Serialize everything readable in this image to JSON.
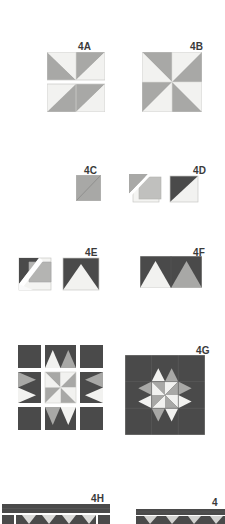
{
  "document": {
    "kind": "quilt-block-piecing-diagram",
    "page_background": "#ffffff"
  },
  "palette": {
    "light": "#f2f2f0",
    "light_shadow": "#e6e6e4",
    "medium": "#a8a8a6",
    "medium_dark": "#8f8f8d",
    "dark": "#4a4a4a",
    "darkest": "#3c3c3c",
    "outline": "#c8c8c6",
    "label_color": "#3a3a3a"
  },
  "figures": [
    {
      "id": "4A",
      "label": "4A",
      "description": "Two hourglass / half-square triangle rectangle units stacked vertically",
      "label_x": 78,
      "label_y": 41,
      "x": 47,
      "y": 52,
      "width": 58,
      "height": 60
    },
    {
      "id": "4B",
      "label": "4B",
      "description": "Four-patch pinwheel square made of eight triangles",
      "label_x": 190,
      "label_y": 41,
      "x": 142,
      "y": 52,
      "width": 60,
      "height": 60
    },
    {
      "id": "4C",
      "label": "4C",
      "description": "Single medium square marked with diagonal stitching line",
      "label_x": 84,
      "label_y": 165,
      "x": 76,
      "y": 175,
      "width": 25,
      "height": 26
    },
    {
      "id": "4D",
      "label": "4D",
      "description": "Sewn and pressed half-square triangle unit, shown folded open beside a finished dark-light triangle square",
      "label_x": 193,
      "label_y": 165,
      "x": 129,
      "y": 173,
      "width": 72,
      "height": 30
    },
    {
      "id": "4E",
      "label": "4E",
      "description": "Flying geese unit in progress and completed dark flying geese with light center triangle",
      "label_x": 85,
      "label_y": 247,
      "x": 17,
      "y": 256,
      "width": 84,
      "height": 36
    },
    {
      "id": "4F",
      "label": "4F",
      "description": "Two joined flying geese units forming a rectangle",
      "label_x": 193,
      "label_y": 247,
      "x": 140,
      "y": 256,
      "width": 62,
      "height": 32
    },
    {
      "id": "4G",
      "label": "4G",
      "description": "Completed nine-patch quilt block with dark background and light pinwheel star",
      "label_x": 196,
      "label_y": 345,
      "x": 125,
      "y": 355,
      "width": 80,
      "height": 80
    },
    {
      "id": "4-exploded",
      "label": "",
      "description": "Exploded nine-patch layout of corner squares, flying geese rows and pinwheel center",
      "label_x": 0,
      "label_y": 0,
      "x": 18,
      "y": 345,
      "width": 85,
      "height": 85
    },
    {
      "id": "4H",
      "label": "4H",
      "description": "Dark sashing strip above a pieced row, partially visible at page bottom",
      "label_x": 91,
      "label_y": 493,
      "x": 2,
      "y": 504,
      "width": 108,
      "height": 20
    },
    {
      "id": "4I",
      "label": "4",
      "description": "Second sashing and block row, partially visible at page bottom right",
      "label_x": 212,
      "label_y": 497,
      "x": 136,
      "y": 509,
      "width": 89,
      "height": 15
    }
  ]
}
